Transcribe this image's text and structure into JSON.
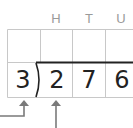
{
  "diagram": {
    "type": "long-division-grid",
    "column_headers": [
      "H",
      "T",
      "U"
    ],
    "divisor": "3",
    "dividend_digits": [
      "2",
      "7",
      "6"
    ],
    "arrows": [
      {
        "target": "divisor",
        "shape": "elbow"
      },
      {
        "target": "hundreds-digit",
        "shape": "straight"
      }
    ],
    "colors": {
      "grid": "#c8c8c8",
      "header_text": "#9a9a9a",
      "digit_text": "#222222",
      "bracket": "#222222",
      "arrow": "#7a7a7a"
    }
  }
}
